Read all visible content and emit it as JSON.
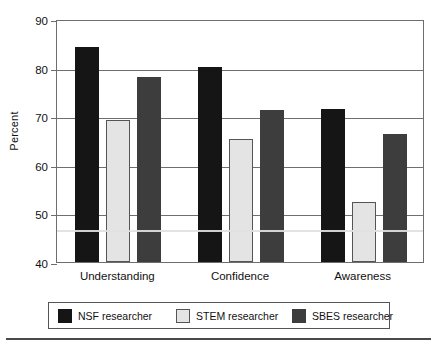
{
  "chart_data": {
    "type": "bar",
    "title": "",
    "subtitle": "",
    "xlabel": "",
    "ylabel": "Percent",
    "ylim": [
      40,
      90
    ],
    "ytick_labels": [
      "90",
      "80",
      "70",
      "60",
      "50",
      "40"
    ],
    "yticks": [
      90,
      80,
      70,
      60,
      50,
      40
    ],
    "grid": true,
    "legend_position": "bottom",
    "categories": [
      "Understanding",
      "Confidence",
      "Awareness"
    ],
    "series": [
      {
        "name": "NSF researcher",
        "color": "#151515",
        "values": [
          84.2,
          80.2,
          71.4
        ]
      },
      {
        "name": "STEM researcher",
        "color": "#e4e4e4",
        "values": [
          69.2,
          65.3,
          52.3
        ]
      },
      {
        "name": "SBES researcher",
        "color": "#3d3d3d",
        "values": [
          78.1,
          71.2,
          66.3
        ]
      }
    ],
    "annotations": []
  },
  "legend": {
    "entries": [
      {
        "label": "NSF researcher"
      },
      {
        "label": "STEM researcher"
      },
      {
        "label": "SBES researcher"
      }
    ]
  },
  "axis": {
    "y_title": "Percent"
  }
}
